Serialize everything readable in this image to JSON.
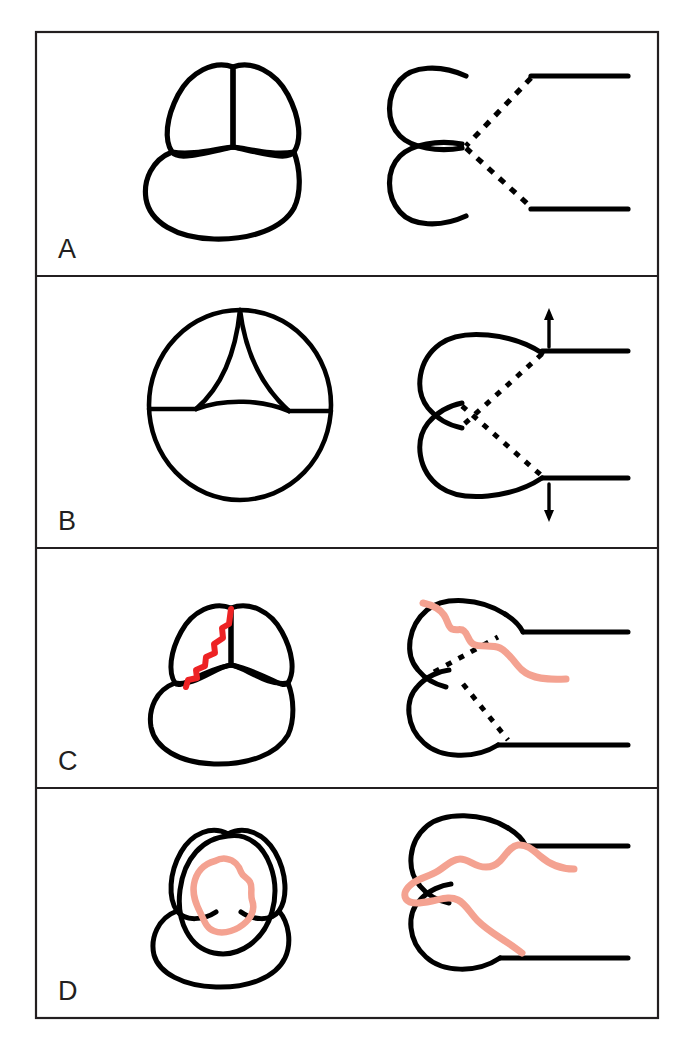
{
  "figure": {
    "width": 696,
    "height": 1050,
    "background_color": "#ffffff",
    "frame": {
      "color": "#231f20",
      "stroke_width": 2,
      "x": 36,
      "y": 32,
      "width": 622,
      "height": 986
    },
    "colors": {
      "ink": "#231f20",
      "line": "#000000",
      "dissection_red": "#ED2224",
      "dissection_salmon": "#F4A291",
      "background": "#ffffff"
    }
  },
  "panels": [
    {
      "id": "A",
      "label": "A",
      "description": "Closed aortic valve. Left: short-axis view showing three coapting cusps forming a Y-shaped closure line. Right: long-axis view with two sinuses and dashed coapting leaflets meeting centrally.",
      "divider_y": 276,
      "label_x": 58,
      "label_y": 258,
      "left_view": "short-axis-closed-trefoil",
      "right_view": "long-axis-closed-leaflets",
      "arrows": [],
      "dissection": "none"
    },
    {
      "id": "B",
      "label": "B",
      "description": "Open aortic valve. Left: short-axis view, circular annulus with three retracted cusps forming a triangular orifice. Right: long-axis view with leaflets swung open toward the aortic wall; arrows show opening direction.",
      "divider_y": 548,
      "label_x": 58,
      "label_y": 530,
      "left_view": "short-axis-open-triangular-orifice",
      "right_view": "long-axis-open-leaflets",
      "arrows": [
        {
          "name": "upward-opening-arrow",
          "direction": "up"
        },
        {
          "name": "downward-opening-arrow",
          "direction": "down"
        }
      ],
      "dissection": "none"
    },
    {
      "id": "C",
      "label": "C",
      "description": "Dissection flap involving one commissure. Left: short-axis view with a red tear along the left cusp margin. Right: long-axis view with a salmon dissection flap stripping the upper sinus wall and trailing into the lumen.",
      "divider_y": 788,
      "label_x": 58,
      "label_y": 770,
      "left_view": "short-axis-commissural-tear",
      "right_view": "long-axis-flap-upper-sinus",
      "arrows": [],
      "dissection": "partial"
    },
    {
      "id": "D",
      "label": "D",
      "description": "Extensive circumferential dissection with prolapse. Left: short-axis view with an overlying prolapsed mass and salmon flap outline. Right: long-axis view with the flap crossing both sinuses and prolapsing through the valve.",
      "divider_y": 1018,
      "label_x": 58,
      "label_y": 1000,
      "left_view": "short-axis-prolapse-outline",
      "right_view": "long-axis-flap-both-sinuses",
      "arrows": [],
      "dissection": "extensive"
    }
  ]
}
